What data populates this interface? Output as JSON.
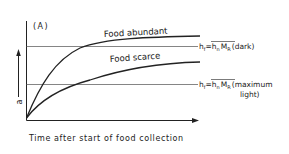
{
  "panel_label": "(A)",
  "y_axis": {
    "label": "a"
  },
  "x_axis": {
    "label": "Time after start of food collection"
  },
  "curves": [
    {
      "name": "Food abundant",
      "label": "Food abundant"
    },
    {
      "name": "Food scarce",
      "label": "Food scarce"
    }
  ],
  "reference_lines": [
    {
      "lhs": "h",
      "lhs_sub": "f",
      "eq": "=",
      "rhs_h": "h",
      "rhs_h_sub": "n",
      "rhs_m": "M",
      "rhs_m_sub": "R",
      "condition": "(dark)"
    },
    {
      "lhs": "h",
      "lhs_sub": "f",
      "eq": "=",
      "rhs_h": "h",
      "rhs_h_sub": "n",
      "rhs_m": "M",
      "rhs_m_sub": "R",
      "condition_line1": "(maximum",
      "condition_line2": "light)"
    }
  ],
  "colors": {
    "ink": "#222222",
    "refline": "#555555",
    "background": "#ffffff"
  }
}
